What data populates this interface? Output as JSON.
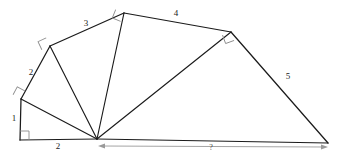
{
  "figure": {
    "kind": "geometry-diagram",
    "canvas": {
      "width": 347,
      "height": 160
    },
    "background_color": "#ffffff",
    "line_color": "#1b1b1b",
    "right_angle_color": "#8d8d8d",
    "dimension_color": "#9a9a9a"
  },
  "vertices": {
    "origin": {
      "name": "bottom-left-corner",
      "x": 20,
      "y": 140
    },
    "v1": {
      "name": "left-vertex",
      "x": 21,
      "y": 99
    },
    "v2": {
      "name": "upper-left-vertex",
      "x": 50,
      "y": 46
    },
    "v3": {
      "name": "apex-vertex",
      "x": 124,
      "y": 13
    },
    "v4": {
      "name": "right-vertex",
      "x": 231,
      "y": 32
    },
    "hub": {
      "name": "hub-vertex",
      "x": 97,
      "y": 139
    },
    "end": {
      "name": "bottom-right-vertex",
      "x": 328,
      "y": 143
    }
  },
  "edges": [
    {
      "name": "side-1",
      "from": "origin",
      "to": "v1"
    },
    {
      "name": "side-2",
      "from": "v1",
      "to": "v2"
    },
    {
      "name": "side-3",
      "from": "v2",
      "to": "v3"
    },
    {
      "name": "side-4",
      "from": "v3",
      "to": "v4"
    },
    {
      "name": "side-5",
      "from": "v4",
      "to": "end"
    },
    {
      "name": "base-segment",
      "from": "origin",
      "to": "hub"
    },
    {
      "name": "unknown-base",
      "from": "hub",
      "to": "end"
    }
  ],
  "spokes": [
    {
      "name": "spoke-to-left-vertex",
      "from": "hub",
      "to": "v1"
    },
    {
      "name": "spoke-to-upper-left-vertex",
      "from": "hub",
      "to": "v2"
    },
    {
      "name": "spoke-to-apex",
      "from": "hub",
      "to": "v3"
    },
    {
      "name": "spoke-to-right-vertex",
      "from": "hub",
      "to": "v4"
    }
  ],
  "right_angles": [
    {
      "name": "right-angle-at-origin",
      "x": 20,
      "y": 140,
      "rotation": 0
    },
    {
      "name": "right-angle-at-left-vertex",
      "x": 21,
      "y": 99,
      "rotation": 28
    },
    {
      "name": "right-angle-at-upper-left-vertex",
      "x": 50,
      "y": 46,
      "rotation": 56
    },
    {
      "name": "right-angle-at-apex",
      "x": 124,
      "y": 13,
      "rotation": 82
    },
    {
      "name": "right-angle-at-right-vertex",
      "x": 231,
      "y": 32,
      "rotation": 116
    }
  ],
  "labels": [
    {
      "name": "label-side-1",
      "text": "1",
      "x": 14,
      "y": 118
    },
    {
      "name": "label-side-2",
      "text": "2",
      "x": 31,
      "y": 72
    },
    {
      "name": "label-side-3",
      "text": "3",
      "x": 86,
      "y": 23
    },
    {
      "name": "label-side-4",
      "text": "4",
      "x": 176,
      "y": 13
    },
    {
      "name": "label-side-5",
      "text": "5",
      "x": 288,
      "y": 76
    },
    {
      "name": "label-base-segment",
      "text": "2",
      "x": 58,
      "y": 146
    },
    {
      "name": "label-unknown",
      "text": "?",
      "x": 211,
      "y": 148
    }
  ],
  "dimension": {
    "name": "unknown-length-dimension",
    "label": "?",
    "from_x": 100,
    "to_x": 326,
    "y": 146,
    "double_headed": true
  }
}
